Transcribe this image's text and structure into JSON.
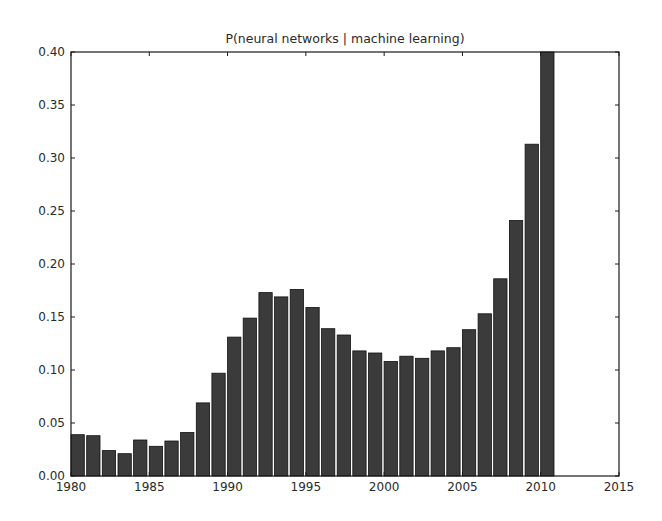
{
  "chart_data": {
    "type": "bar",
    "title": "P(neural networks | machine learning)",
    "xlabel": "",
    "ylabel": "",
    "xlim": [
      1980,
      2015
    ],
    "ylim": [
      0.0,
      0.4
    ],
    "grid": false,
    "legend": null,
    "x_ticks": [
      "1980",
      "1985",
      "1990",
      "1995",
      "2000",
      "2005",
      "2010",
      "2015"
    ],
    "y_ticks": [
      "0.00",
      "0.05",
      "0.10",
      "0.15",
      "0.20",
      "0.25",
      "0.30",
      "0.35",
      "0.40"
    ],
    "categories": [
      1980,
      1981,
      1982,
      1983,
      1984,
      1985,
      1986,
      1987,
      1988,
      1989,
      1990,
      1991,
      1992,
      1993,
      1994,
      1995,
      1996,
      1997,
      1998,
      1999,
      2000,
      2001,
      2002,
      2003,
      2004,
      2005,
      2006,
      2007,
      2008,
      2009,
      2010
    ],
    "values": [
      0.039,
      0.038,
      0.024,
      0.021,
      0.034,
      0.028,
      0.033,
      0.041,
      0.069,
      0.097,
      0.131,
      0.149,
      0.173,
      0.169,
      0.176,
      0.159,
      0.139,
      0.133,
      0.118,
      0.116,
      0.108,
      0.113,
      0.111,
      0.118,
      0.121,
      0.138,
      0.153,
      0.186,
      0.241,
      0.313,
      0.4
    ],
    "bar_width": 0.85,
    "colors": {
      "bar_fill": "#3b3b3b",
      "bar_edge": "#111111",
      "axes": "#1a1a1a",
      "background": "#ffffff"
    }
  }
}
